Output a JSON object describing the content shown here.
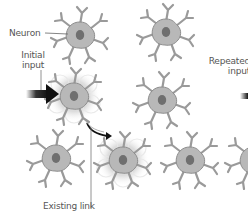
{
  "diagram": {
    "type": "neuron-network",
    "colors": {
      "background": "#ffffff",
      "neuron_body": "#b9b9b9",
      "neuron_outline": "#8a8a8a",
      "nucleus": "#6e6e6e",
      "glow": "#cfcfcf",
      "arrow": "#111111",
      "leader_line": "#666666",
      "label_text": "#555555"
    },
    "labels": {
      "neuron": "Neuron",
      "initial_input_line1": "Initial",
      "initial_input_line2": "input",
      "existing_link": "Existing link",
      "repeated_input_line1": "Repeated",
      "repeated_input_line2": "input"
    },
    "neurons": [
      {
        "id": "n1",
        "x": 80,
        "y": 35,
        "active": false
      },
      {
        "id": "n2",
        "x": 166,
        "y": 32,
        "active": false
      },
      {
        "id": "n3",
        "x": 74,
        "y": 96,
        "active": true
      },
      {
        "id": "n4",
        "x": 162,
        "y": 100,
        "active": false
      },
      {
        "id": "n5",
        "x": 56,
        "y": 158,
        "active": false
      },
      {
        "id": "n6",
        "x": 123,
        "y": 160,
        "active": true
      },
      {
        "id": "n7",
        "x": 190,
        "y": 160,
        "active": false
      },
      {
        "id": "n8",
        "x": 252,
        "y": 160,
        "active": false
      }
    ]
  }
}
